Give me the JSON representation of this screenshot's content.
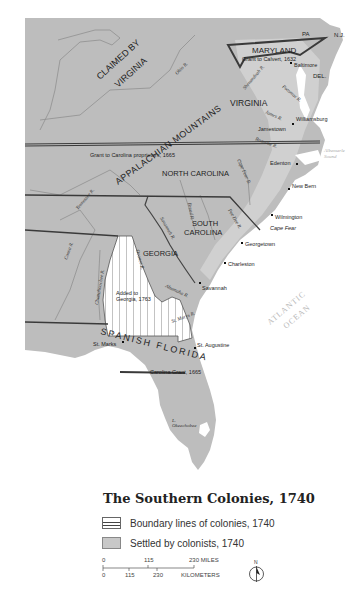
{
  "map": {
    "title": "The Southern Colonies, 1740",
    "regions": {
      "claimed_by_virginia": "CLAIMED BY VIRGINIA",
      "claimed_line1": "CLAIMED BY",
      "claimed_line2": "VIRGINIA",
      "maryland": "MARYLAND",
      "maryland_grant": "Grant to Calvert, 1632",
      "pa": "PA",
      "nj": "N.J.",
      "del": "DEL.",
      "virginia": "VIRGINIA",
      "appalachian": "APPALACHIAN MOUNTAINS",
      "carolina_grant": "Grant to Carolina proprietors, 1665",
      "north_carolina": "NORTH CAROLINA",
      "south_carolina_line1": "SOUTH",
      "south_carolina_line2": "CAROLINA",
      "georgia": "GEORGIA",
      "added_to_georgia_line1": "Added to",
      "added_to_georgia_line2": "Georgia, 1763",
      "spanish_florida": "SPANISH FLORIDA",
      "carolina_grant_south": "Carolina Grant, 1665",
      "atlantic_line1": "ATLANTIC",
      "atlantic_line2": "OCEAN",
      "albemarle_line1": "Albemarle",
      "albemarle_line2": "Sound"
    },
    "cities": {
      "baltimore": "Baltimore",
      "williamsburg": "Williamsburg",
      "jamestown": "Jamestown",
      "edenton": "Edenton",
      "new_bern": "New Bern",
      "wilmington": "Wilmington",
      "cape_fear": "Cape Fear",
      "georgetown": "Georgetown",
      "charleston": "Charleston",
      "savannah": "Savannah",
      "st_augustine": "St. Augustine",
      "st_marks": "St. Marks"
    },
    "rivers": {
      "ohio": "Ohio R.",
      "shenandoah": "Shenandoah R.",
      "potomac": "Potomac R.",
      "james": "James R.",
      "roanoke": "Roanoke R.",
      "tennessee": "Tennessee R.",
      "cape_fear": "Cape Fear R.",
      "broad": "Broad R.",
      "pee_dee": "Pee Dee R.",
      "savannah": "Savannah R.",
      "coosa": "Coosa R.",
      "chattahoochee": "Chattahoochee R.",
      "oconee": "Oconee R.",
      "altamaha": "Altamaha R.",
      "st_marys": "St. Marys R.",
      "okeechobee_line1": "L.",
      "okeechobee_line2": "Okeechobee"
    }
  },
  "legend": {
    "title": "The Southern Colonies, 1740",
    "items": [
      {
        "label": "Boundary lines of colonies, 1740",
        "swatch": "boundary"
      },
      {
        "label": "Settled by colonists, 1740",
        "swatch": "settled"
      }
    ],
    "scale": {
      "miles": [
        "0",
        "115",
        "230 MILES"
      ],
      "kilometers": [
        "0",
        "115",
        "230",
        "KILOMETERS"
      ]
    },
    "compass": "N"
  },
  "colors": {
    "land": "#bdbdbd",
    "settled": "#d4d4d4",
    "water": "#ffffff",
    "boundary": "#3a3a3a",
    "river": "#8a8a8a"
  }
}
